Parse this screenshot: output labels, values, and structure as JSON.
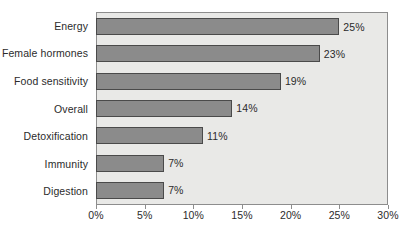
{
  "chart_data": {
    "type": "bar",
    "orientation": "horizontal",
    "title": "",
    "subtitle": "",
    "xlabel": "",
    "ylabel": "",
    "categories": [
      "Energy",
      "Female hormones",
      "Food sensitivity",
      "Overall",
      "Detoxification",
      "Immunity",
      "Digestion"
    ],
    "values": [
      25,
      23,
      19,
      14,
      11,
      7,
      7
    ],
    "value_labels": [
      "25%",
      "23%",
      "19%",
      "14%",
      "11%",
      "7%",
      "7%"
    ],
    "xlim": [
      0,
      30
    ],
    "xticks": [
      0,
      5,
      10,
      15,
      20,
      25,
      30
    ],
    "xtick_labels": [
      "0%",
      "5%",
      "10%",
      "15%",
      "20%",
      "25%",
      "30%"
    ],
    "grid": false,
    "legend": false,
    "legend_position": "none",
    "colors": {
      "bar_fill": "#8b8b8b",
      "bar_border": "#4a4a4a",
      "plot_background": "#e9e9e7",
      "plot_border": "#8d8d8d",
      "text": "#2b2b2b",
      "page_background": "#ffffff"
    }
  }
}
